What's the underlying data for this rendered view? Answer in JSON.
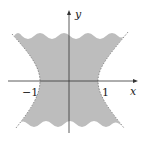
{
  "diagram": {
    "axes": {
      "x_label": "x",
      "y_label": "y"
    },
    "ticks": {
      "neg_one": "−1",
      "pos_one": "1"
    },
    "region": {
      "fill_color": "#bdbdbd",
      "boundary_style": "dashed hyperbolic sides, wavy top and bottom edges"
    },
    "colors": {
      "axis": "#333333",
      "region": "#bdbdbd",
      "boundary": "#777777"
    }
  }
}
